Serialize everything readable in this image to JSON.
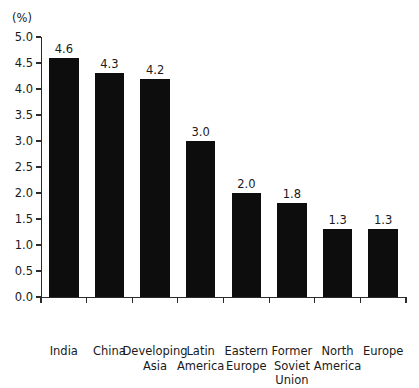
{
  "figure": {
    "unit_label": "(%)",
    "clipped_header_text": "",
    "background_color": "#ffffff",
    "bar_color": "#0d0d0d",
    "axis_color": "#2b2b2b",
    "text_color": "#1a1a1a"
  },
  "chart_data": {
    "type": "bar",
    "title": "",
    "subtitle": "",
    "xlabel": "",
    "ylabel": "(%)",
    "ylim": [
      0.0,
      5.0
    ],
    "ytick_step": 0.5,
    "grid": false,
    "legend": false,
    "legend_position": "none",
    "value_labels_shown": true,
    "categories": [
      "India",
      "China",
      "Developing\nAsia",
      "Latin\nAmerica",
      "Eastern\nEurope",
      "Former\nSoviet\nUnion",
      "North\nAmerica",
      "Europe"
    ],
    "values": [
      4.6,
      4.3,
      4.2,
      3.0,
      2.0,
      1.8,
      1.3,
      1.3
    ],
    "value_label_texts": [
      "4.6",
      "4.3",
      "4.2",
      "3.0",
      "2.0",
      "1.8",
      "1.3",
      "1.3"
    ],
    "ytick_labels": [
      "0.0",
      "0.5",
      "1.0",
      "1.5",
      "2.0",
      "2.5",
      "3.0",
      "3.5",
      "4.0",
      "4.5",
      "5.0"
    ],
    "ytick_values": [
      0.0,
      0.5,
      1.0,
      1.5,
      2.0,
      2.5,
      3.0,
      3.5,
      4.0,
      4.5,
      5.0
    ]
  }
}
